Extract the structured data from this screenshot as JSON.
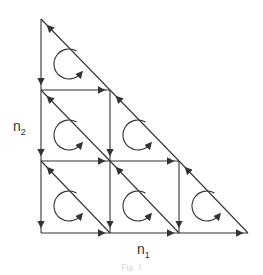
{
  "labels": {
    "y_axis": "n",
    "y_axis_sub": "2",
    "x_axis": "n",
    "x_axis_sub": "1"
  },
  "caption": "Fig. 1",
  "colors": {
    "stroke": "#333333",
    "background": "#ffffff"
  },
  "grid": {
    "x": [
      41,
      110,
      179,
      248
    ],
    "y": [
      19,
      90,
      161,
      233
    ]
  },
  "edges": {
    "vertical_down": [
      [
        0,
        0,
        1
      ],
      [
        0,
        1,
        2
      ],
      [
        0,
        2,
        3
      ],
      [
        1,
        1,
        2
      ],
      [
        1,
        2,
        3
      ],
      [
        2,
        2,
        3
      ]
    ],
    "horizontal_right": [
      [
        1,
        0,
        1
      ],
      [
        2,
        0,
        1
      ],
      [
        2,
        1,
        2
      ],
      [
        3,
        0,
        1
      ],
      [
        3,
        1,
        2
      ],
      [
        3,
        2,
        3
      ]
    ],
    "diagonal_up_left": [
      [
        0,
        0,
        1,
        1
      ],
      [
        1,
        1,
        2,
        2
      ],
      [
        2,
        2,
        3,
        3
      ],
      [
        0,
        1,
        1,
        2
      ],
      [
        1,
        2,
        2,
        3
      ],
      [
        0,
        2,
        1,
        3
      ]
    ]
  },
  "circulations": [
    [
      0,
      0
    ],
    [
      0,
      1
    ],
    [
      1,
      1
    ],
    [
      0,
      2
    ],
    [
      1,
      2
    ],
    [
      2,
      2
    ]
  ]
}
